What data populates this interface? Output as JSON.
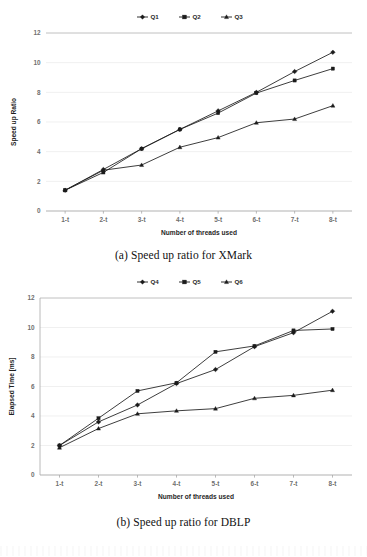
{
  "figure": {
    "charts": [
      {
        "id": "chart-a",
        "caption": "(a) Speed up ratio for XMark",
        "chart_data": {
          "type": "line",
          "title": "",
          "xlabel": "Number of threads used",
          "ylabel": "Speed up Ratio",
          "categories": [
            "1-t",
            "2-t",
            "3-t",
            "4-t",
            "5-t",
            "6-t",
            "7-t",
            "8-t"
          ],
          "yticks": [
            0,
            2,
            4,
            6,
            8,
            10,
            12
          ],
          "ylim": [
            0,
            12
          ],
          "grid": true,
          "legend_position": "top-center",
          "series": [
            {
              "name": "Q1",
              "marker": "diamond",
              "values": [
                1.4,
                2.8,
                4.2,
                5.5,
                6.75,
                8.0,
                9.4,
                10.7
              ]
            },
            {
              "name": "Q2",
              "marker": "square",
              "values": [
                1.4,
                2.6,
                4.2,
                5.5,
                6.6,
                7.95,
                8.8,
                9.6
              ]
            },
            {
              "name": "Q3",
              "marker": "triangle",
              "values": [
                1.4,
                2.75,
                3.1,
                4.3,
                4.95,
                5.95,
                6.2,
                7.1
              ]
            }
          ]
        }
      },
      {
        "id": "chart-b",
        "caption": "(b) Speed up ratio for DBLP",
        "chart_data": {
          "type": "line",
          "title": "",
          "xlabel": "Number of threads used",
          "ylabel": "Elapsed Time [ms]",
          "categories": [
            "1-t",
            "2-t",
            "3-t",
            "4-t",
            "5-t",
            "6-t",
            "7-t",
            "8-t"
          ],
          "yticks": [
            0,
            2,
            4,
            6,
            8,
            10,
            12
          ],
          "ylim": [
            0,
            12
          ],
          "grid": true,
          "legend_position": "top-center",
          "series": [
            {
              "name": "Q4",
              "marker": "diamond",
              "values": [
                2.0,
                3.6,
                4.75,
                6.2,
                7.15,
                8.7,
                9.65,
                11.1
              ]
            },
            {
              "name": "Q5",
              "marker": "square",
              "values": [
                2.0,
                3.85,
                5.7,
                6.25,
                8.35,
                8.75,
                9.8,
                9.9
              ]
            },
            {
              "name": "Q6",
              "marker": "triangle",
              "values": [
                1.85,
                3.15,
                4.15,
                4.35,
                4.5,
                5.2,
                5.4,
                5.75
              ]
            }
          ]
        }
      }
    ]
  }
}
